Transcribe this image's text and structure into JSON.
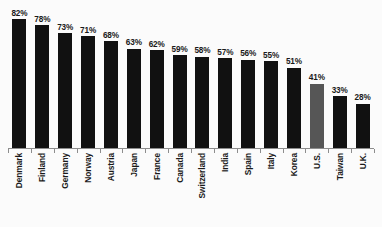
{
  "chart_data": {
    "type": "bar",
    "title": "",
    "subtitle": "",
    "xlabel": "",
    "ylabel": "",
    "ylim": [
      0,
      90
    ],
    "grid": false,
    "legend": "none",
    "label_suffix": "%",
    "categories": [
      "Denmark",
      "Finland",
      "Germany",
      "Norway",
      "Austria",
      "Japan",
      "France",
      "Canada",
      "Switzerland",
      "India",
      "Spain",
      "Italy",
      "Korea",
      "U.S.",
      "Taiwan",
      "U.K."
    ],
    "values": [
      82,
      78,
      73,
      71,
      68,
      63,
      62,
      59,
      58,
      57,
      56,
      55,
      51,
      41,
      33,
      28
    ],
    "data_labels": [
      "82%",
      "78%",
      "73%",
      "71%",
      "68%",
      "63%",
      "62%",
      "59%",
      "58%",
      "57%",
      "56%",
      "55%",
      "51%",
      "41%",
      "33%",
      "28%"
    ],
    "highlight_index": 13,
    "colors": {
      "bar": "#111111",
      "bar_highlight": "#565656",
      "axis": "#8d8d8d",
      "text": "#1a1a1a",
      "background": "#fbfbfb"
    }
  }
}
